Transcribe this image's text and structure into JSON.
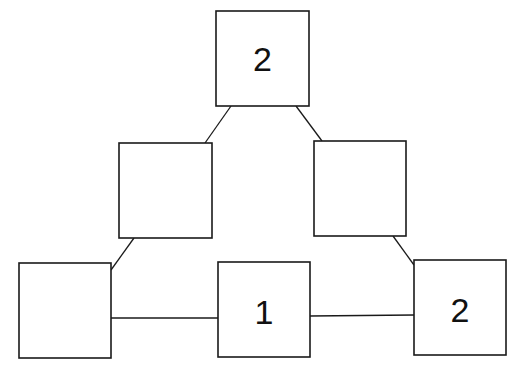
{
  "diagram": {
    "type": "tree-graph",
    "nodes": [
      {
        "id": "top",
        "label": "2",
        "x": 216,
        "y": 11,
        "w": 93,
        "h": 95
      },
      {
        "id": "mid-left",
        "label": "",
        "x": 119,
        "y": 143,
        "w": 93,
        "h": 95
      },
      {
        "id": "mid-right",
        "label": "",
        "x": 314,
        "y": 141,
        "w": 92,
        "h": 95
      },
      {
        "id": "bottom-left",
        "label": "",
        "x": 19,
        "y": 263,
        "w": 92,
        "h": 95
      },
      {
        "id": "bottom-center",
        "label": "1",
        "x": 218,
        "y": 262,
        "w": 92,
        "h": 95
      },
      {
        "id": "bottom-right",
        "label": "2",
        "x": 414,
        "y": 260,
        "w": 92,
        "h": 95
      }
    ],
    "edges": [
      {
        "from": "top",
        "to": "mid-left",
        "x1": 231,
        "y1": 106,
        "x2": 205,
        "y2": 143
      },
      {
        "from": "top",
        "to": "mid-right",
        "x1": 296,
        "y1": 106,
        "x2": 322,
        "y2": 141
      },
      {
        "from": "mid-left",
        "to": "bottom-left",
        "x1": 134,
        "y1": 238,
        "x2": 111,
        "y2": 270
      },
      {
        "from": "mid-right",
        "to": "bottom-right",
        "x1": 393,
        "y1": 236,
        "x2": 414,
        "y2": 265
      },
      {
        "from": "bottom-left",
        "to": "bottom-center",
        "x1": 111,
        "y1": 318,
        "x2": 218,
        "y2": 318
      },
      {
        "from": "bottom-center",
        "to": "bottom-right",
        "x1": 310,
        "y1": 316,
        "x2": 414,
        "y2": 315
      }
    ]
  }
}
